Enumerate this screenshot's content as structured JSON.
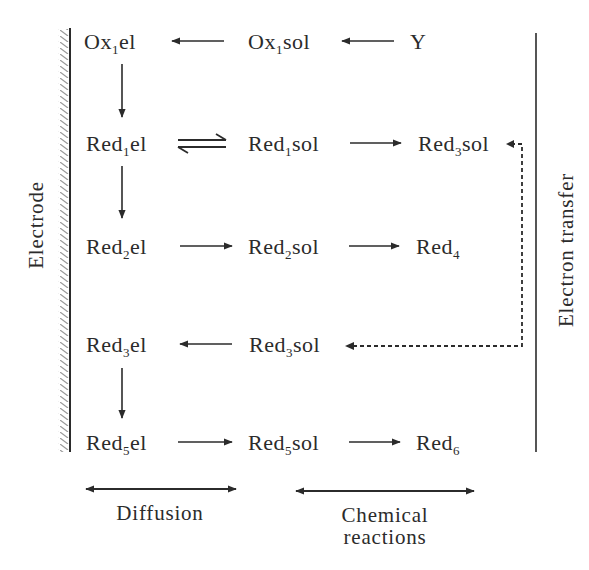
{
  "diagram": {
    "type": "reaction-scheme",
    "colors": {
      "ink": "#2b2b2b",
      "background": "#ffffff",
      "hatch": "#9a9a9a"
    },
    "side_labels": {
      "left": "Electrode",
      "right": "Electron transfer"
    },
    "species": {
      "ox1el": {
        "base": "Ox",
        "sub": "1",
        "suffix": "el"
      },
      "ox1sol": {
        "base": "Ox",
        "sub": "1",
        "suffix": "sol"
      },
      "y": {
        "base": "Y",
        "sub": "",
        "suffix": ""
      },
      "red1el": {
        "base": "Red",
        "sub": "1",
        "suffix": "el"
      },
      "red1sol": {
        "base": "Red",
        "sub": "1",
        "suffix": "sol"
      },
      "red3sol_top": {
        "base": "Red",
        "sub": "3",
        "suffix": "sol"
      },
      "red2el": {
        "base": "Red",
        "sub": "2",
        "suffix": "el"
      },
      "red2sol": {
        "base": "Red",
        "sub": "2",
        "suffix": "sol"
      },
      "red4": {
        "base": "Red",
        "sub": "4",
        "suffix": ""
      },
      "red3el": {
        "base": "Red",
        "sub": "3",
        "suffix": "el"
      },
      "red3sol": {
        "base": "Red",
        "sub": "3",
        "suffix": "sol"
      },
      "red5el": {
        "base": "Red",
        "sub": "5",
        "suffix": "el"
      },
      "red5sol": {
        "base": "Red",
        "sub": "5",
        "suffix": "sol"
      },
      "red6": {
        "base": "Red",
        "sub": "6",
        "suffix": ""
      }
    },
    "arrows": [
      {
        "from": "Ox1sol",
        "to": "Ox1el",
        "style": "solid"
      },
      {
        "from": "Y",
        "to": "Ox1sol",
        "style": "solid"
      },
      {
        "from": "Ox1el",
        "to": "Red1el",
        "style": "solid"
      },
      {
        "from": "Red1el",
        "to": "Red1sol",
        "style": "equilibrium"
      },
      {
        "from": "Red1sol",
        "to": "Red3sol",
        "style": "solid"
      },
      {
        "from": "Red1el",
        "to": "Red2el",
        "style": "solid"
      },
      {
        "from": "Red2el",
        "to": "Red2sol",
        "style": "solid"
      },
      {
        "from": "Red2sol",
        "to": "Red4",
        "style": "solid"
      },
      {
        "from": "Red3sol",
        "to": "Red3el",
        "style": "solid"
      },
      {
        "from": "Red3sol (top)",
        "to": "Red3sol (row 4)",
        "style": "dashed"
      },
      {
        "from": "Red3el",
        "to": "Red5el",
        "style": "solid"
      },
      {
        "from": "Red5el",
        "to": "Red5sol",
        "style": "solid"
      },
      {
        "from": "Red5sol",
        "to": "Red6",
        "style": "solid"
      }
    ],
    "footer": {
      "diffusion": "Diffusion",
      "chemical_line1": "Chemical",
      "chemical_line2": "reactions"
    }
  }
}
